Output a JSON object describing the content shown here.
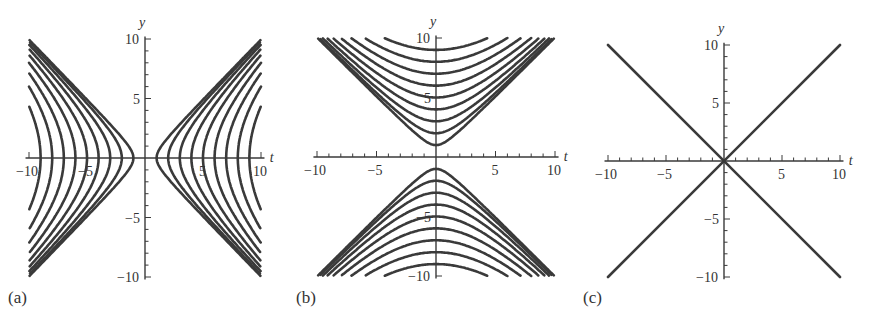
{
  "chart_data": [
    {
      "panel": "(a)",
      "type": "line",
      "description": "Family of hyperbolas t^2 - y^2 = k^2 opening left/right",
      "equation": "t^2 - y^2 = k^2",
      "k_values": [
        1,
        2,
        3,
        4,
        5,
        6,
        7,
        8,
        9
      ],
      "xlabel": "t",
      "ylabel": "y",
      "xlim": [
        -10,
        10
      ],
      "ylim": [
        -10,
        10
      ],
      "xticks": [
        -10,
        -5,
        5,
        10
      ],
      "yticks": [
        -10,
        -5,
        5,
        10
      ],
      "grid": false
    },
    {
      "panel": "(b)",
      "type": "line",
      "description": "Family of hyperbolas y^2 - t^2 = k^2 opening up/down",
      "equation": "y^2 - t^2 = k^2",
      "k_values": [
        1,
        2,
        3,
        4,
        5,
        6,
        7,
        8,
        9
      ],
      "xlabel": "t",
      "ylabel": "y",
      "xlim": [
        -10,
        10
      ],
      "ylim": [
        -10,
        10
      ],
      "xticks": [
        -10,
        -5,
        5,
        10
      ],
      "yticks": [
        -10,
        -5,
        5,
        10
      ],
      "grid": false
    },
    {
      "panel": "(c)",
      "type": "line",
      "description": "Degenerate case: lines y = t and y = -t",
      "series": [
        {
          "name": "y = t",
          "x": [
            -10,
            10
          ],
          "y": [
            -10,
            10
          ]
        },
        {
          "name": "y = -t",
          "x": [
            -10,
            10
          ],
          "y": [
            10,
            -10
          ]
        }
      ],
      "xlabel": "t",
      "ylabel": "y",
      "xlim": [
        -10,
        10
      ],
      "ylim": [
        -10,
        10
      ],
      "xticks": [
        -10,
        -5,
        5,
        10
      ],
      "yticks": [
        -10,
        -5,
        5,
        10
      ],
      "grid": false
    }
  ],
  "panels": [
    {
      "label": "(a)",
      "xlabel": "t",
      "ylabel": "y",
      "ticks": {
        "x_neg10": "−10",
        "x_neg5": "−5",
        "x_5": "5",
        "x_10": "10",
        "y_10": "10",
        "y_5": "5",
        "y_neg5": "−5",
        "y_neg10": "−10"
      }
    },
    {
      "label": "(b)",
      "xlabel": "t",
      "ylabel": "y",
      "ticks": {
        "x_neg10": "−10",
        "x_neg5": "−5",
        "x_5": "5",
        "x_10": "10",
        "y_10": "10",
        "y_5": "5",
        "y_neg5": "−5",
        "y_neg10": "−10"
      }
    },
    {
      "label": "(c)",
      "xlabel": "t",
      "ylabel": "y",
      "ticks": {
        "x_neg10": "−10",
        "x_neg5": "−5",
        "x_5": "5",
        "x_10": "10",
        "y_10": "10",
        "y_5": "5",
        "y_neg5": "−5",
        "y_neg10": "−10"
      }
    }
  ],
  "colors": {
    "curve": "#3a3a3a",
    "background": "#ffffff"
  }
}
